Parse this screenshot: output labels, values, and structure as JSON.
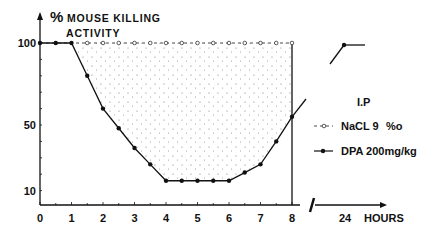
{
  "chart_data": {
    "type": "line",
    "title": "",
    "ylabel": "% MOUSE KILLING ACTIVITY",
    "xlabel": "HOURS",
    "x_ticks": [
      "0",
      "1",
      "2",
      "3",
      "4",
      "5",
      "6",
      "7",
      "8",
      "24"
    ],
    "y_ticks": [
      "10",
      "50",
      "100"
    ],
    "ylim": [
      0,
      100
    ],
    "annotation": "I.P",
    "legend_position": "right",
    "series": [
      {
        "name": "NaCL 9‰",
        "marker": "open-circle",
        "style": "dashed",
        "x": [
          0,
          0.5,
          1,
          1.5,
          2,
          2.5,
          3,
          3.5,
          4,
          4.5,
          5,
          5.5,
          6,
          6.5,
          7,
          7.5,
          8,
          24
        ],
        "values": [
          100,
          100,
          100,
          100,
          100,
          100,
          100,
          100,
          100,
          100,
          100,
          100,
          100,
          100,
          100,
          100,
          100,
          100
        ]
      },
      {
        "name": "DPA 200mg/kg",
        "marker": "filled-circle",
        "style": "solid",
        "x": [
          0,
          0.5,
          1,
          1.5,
          2,
          2.5,
          3,
          3.5,
          4,
          4.5,
          5,
          5.5,
          6,
          6.5,
          7,
          7.5,
          8,
          24
        ],
        "values": [
          100,
          100,
          100,
          80,
          60,
          48,
          36,
          26,
          16,
          16,
          16,
          16,
          16,
          21,
          26,
          40,
          55,
          100
        ]
      }
    ]
  },
  "labels": {
    "ylabel_line1": "MOUSE KILLING",
    "ylabel_line2": "ACTIVITY",
    "percent": "%",
    "xlabel": "HOURS",
    "annotation": "I.P",
    "legend_nacl_prefix": "NaCL 9",
    "legend_nacl_suffix": "%o",
    "legend_dpa": "DPA 200mg/kg"
  }
}
